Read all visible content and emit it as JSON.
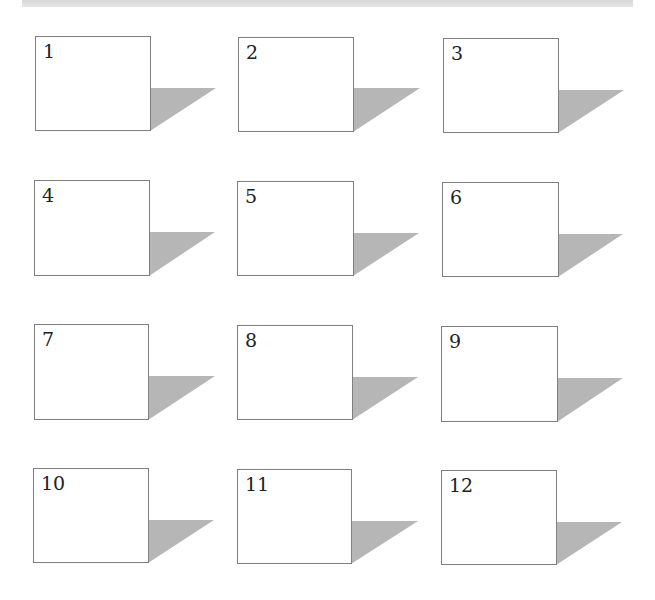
{
  "header_band": {
    "color": "#dcdcdc"
  },
  "colors": {
    "box_border": "#7f7f7f",
    "box_fill": "#ffffff",
    "shadow": "#b6b6b6",
    "label": "#222222"
  },
  "boxes": [
    {
      "label": "1",
      "x": 35,
      "y": 36,
      "w": 116,
      "h": 95,
      "shadow_top": 88,
      "shadow_tip_x": 216
    },
    {
      "label": "2",
      "x": 238,
      "y": 37,
      "w": 116,
      "h": 95,
      "shadow_top": 88,
      "shadow_tip_x": 420
    },
    {
      "label": "3",
      "x": 443,
      "y": 38,
      "w": 116,
      "h": 95,
      "shadow_top": 90,
      "shadow_tip_x": 624
    },
    {
      "label": "4",
      "x": 34,
      "y": 180,
      "w": 116,
      "h": 96,
      "shadow_top": 232,
      "shadow_tip_x": 215
    },
    {
      "label": "5",
      "x": 237,
      "y": 181,
      "w": 117,
      "h": 95,
      "shadow_top": 233,
      "shadow_tip_x": 419
    },
    {
      "label": "6",
      "x": 442,
      "y": 182,
      "w": 117,
      "h": 95,
      "shadow_top": 234,
      "shadow_tip_x": 623
    },
    {
      "label": "7",
      "x": 34,
      "y": 324,
      "w": 115,
      "h": 96,
      "shadow_top": 376,
      "shadow_tip_x": 215
    },
    {
      "label": "8",
      "x": 237,
      "y": 325,
      "w": 116,
      "h": 95,
      "shadow_top": 377,
      "shadow_tip_x": 418
    },
    {
      "label": "9",
      "x": 441,
      "y": 326,
      "w": 117,
      "h": 96,
      "shadow_top": 378,
      "shadow_tip_x": 623
    },
    {
      "label": "10",
      "x": 33,
      "y": 468,
      "w": 116,
      "h": 95,
      "shadow_top": 520,
      "shadow_tip_x": 214
    },
    {
      "label": "11",
      "x": 237,
      "y": 469,
      "w": 115,
      "h": 95,
      "shadow_top": 521,
      "shadow_tip_x": 418
    },
    {
      "label": "12",
      "x": 441,
      "y": 470,
      "w": 116,
      "h": 95,
      "shadow_top": 522,
      "shadow_tip_x": 622
    }
  ]
}
